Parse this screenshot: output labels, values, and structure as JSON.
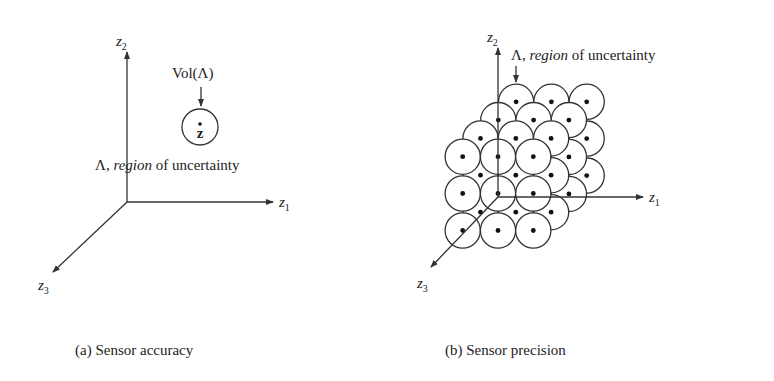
{
  "panel_a": {
    "caption": "(a) Sensor accuracy",
    "axes": {
      "z1": "z",
      "z1_sub": "1",
      "z2": "z",
      "z2_sub": "2",
      "z3": "z",
      "z3_sub": "3"
    },
    "vol_label": "Vol(Λ)",
    "point_label": "z",
    "region_label_prefix": "Λ, ",
    "region_label_italic": "region",
    "region_label_suffix": " of uncertainty"
  },
  "panel_b": {
    "caption": "(b) Sensor precision",
    "axes": {
      "z1": "z",
      "z1_sub": "1",
      "z2": "z",
      "z2_sub": "2",
      "z3": "z",
      "z3_sub": "3"
    },
    "region_label_prefix": "Λ, ",
    "region_label_italic": "region",
    "region_label_suffix": " of uncertainty",
    "lattice": {
      "layers": 4,
      "rows": 3,
      "cols": 3
    }
  }
}
